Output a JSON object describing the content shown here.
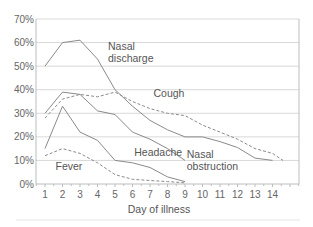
{
  "chart_data": {
    "type": "line",
    "title": "",
    "xlabel": "Day of illness",
    "ylabel": "",
    "xlim": [
      0.5,
      15.5
    ],
    "ylim": [
      0,
      70
    ],
    "grid": true,
    "yticks": [
      0,
      10,
      20,
      30,
      40,
      50,
      60,
      70
    ],
    "ytick_labels": [
      "0%",
      "10%",
      "20%",
      "30%",
      "40%",
      "50%",
      "60%",
      "70%"
    ],
    "xticks": [
      1,
      2,
      3,
      4,
      5,
      6,
      7,
      8,
      9,
      10,
      11,
      12,
      13,
      14
    ],
    "xtick_labels": [
      "1",
      "2",
      "3",
      "4",
      "5",
      "6",
      "7",
      "8",
      "9",
      "10",
      "11",
      "12",
      "13",
      "14"
    ],
    "series": [
      {
        "name": "Nasal discharge",
        "style": "solid",
        "x": [
          1,
          2,
          3,
          4,
          5,
          6,
          7,
          8,
          9,
          10,
          11,
          12,
          13,
          14
        ],
        "values": [
          50,
          60,
          61,
          53,
          40,
          33,
          27,
          23,
          20,
          20,
          18,
          15.5,
          11,
          10
        ]
      },
      {
        "name": "Cough",
        "style": "dashed",
        "x": [
          1,
          2,
          3,
          4,
          5,
          6,
          7,
          8,
          9,
          10,
          11,
          12,
          13,
          14,
          14.6
        ],
        "values": [
          28,
          36,
          38,
          37,
          39,
          35,
          32,
          30,
          29,
          25,
          22,
          19,
          15,
          13,
          10
        ]
      },
      {
        "name": "Nasal obstruction",
        "style": "solid",
        "x": [
          1,
          2,
          3,
          4,
          5,
          6,
          7,
          8,
          9
        ],
        "values": [
          30,
          39,
          38,
          31,
          29.5,
          22,
          19,
          15,
          10
        ]
      },
      {
        "name": "Headache",
        "style": "solid",
        "x": [
          1,
          2,
          3,
          4,
          5,
          6,
          7,
          8,
          9
        ],
        "values": [
          15,
          33,
          22,
          18.5,
          10,
          9,
          7,
          3,
          1
        ]
      },
      {
        "name": "Fever",
        "style": "dashed",
        "x": [
          1,
          2,
          3,
          4,
          5,
          6,
          7,
          8,
          9
        ],
        "values": [
          12,
          15,
          13,
          9,
          4,
          2,
          1.5,
          1,
          0.5
        ]
      }
    ],
    "annotations": [
      {
        "text_lines": [
          "Nasal",
          "discharge"
        ],
        "x": 4.6,
        "y": 57
      },
      {
        "text_lines": [
          "Cough"
        ],
        "x": 7.2,
        "y": 37
      },
      {
        "text_lines": [
          "Headache"
        ],
        "x": 6.1,
        "y": 12
      },
      {
        "text_lines": [
          "Nasal",
          "obstruction"
        ],
        "x": 9.1,
        "y": 11
      },
      {
        "text_lines": [
          "Fever"
        ],
        "x": 1.6,
        "y": 6
      }
    ],
    "colors": {
      "line": "#8a8a8a",
      "grid": "#d9d9d9",
      "axis": "#bdbdbd",
      "text": "#555555"
    }
  }
}
